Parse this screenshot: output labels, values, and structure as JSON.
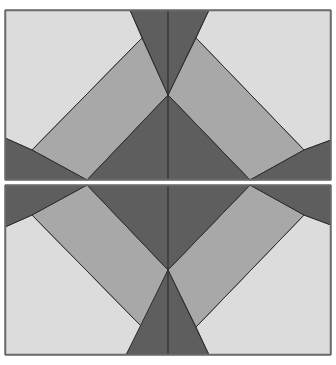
{
  "figure": {
    "colors": {
      "background": "#ffffff",
      "light": "#dcdcdc",
      "medium": "#a8a8a8",
      "dark": "#5e5e5e",
      "stroke": "#2e2e2e",
      "frame": "#6a6a6a"
    },
    "panels": [
      {
        "name": "top-panel",
        "frame": [
          5,
          10,
          326,
          170
        ],
        "shapes": [
          {
            "name": "light-left",
            "fill": "light",
            "points": "5,10 130,10 142,38 32,150 5,138"
          },
          {
            "name": "light-right",
            "fill": "light",
            "points": "209,10 331,10 331,140 304,150 196,38"
          },
          {
            "name": "band-left",
            "fill": "medium",
            "points": "142,38 168,95 87,180 32,150"
          },
          {
            "name": "band-right",
            "fill": "medium",
            "points": "168,95 196,38 304,150 250,180"
          },
          {
            "name": "notch-top",
            "fill": "dark",
            "points": "130,10 209,10 168,95"
          },
          {
            "name": "triangle-center",
            "fill": "dark",
            "points": "87,180 168,95 250,180"
          },
          {
            "name": "corner-left",
            "fill": "dark",
            "points": "5,138 32,150 87,180 5,180"
          },
          {
            "name": "corner-right",
            "fill": "dark",
            "points": "250,180 304,150 331,140 331,180"
          }
        ],
        "center_line": [
          168,
          10,
          168,
          180
        ]
      },
      {
        "name": "bottom-panel",
        "frame": [
          5,
          185,
          326,
          170
        ],
        "shapes": [
          {
            "name": "light-left",
            "fill": "light",
            "points": "5,355 126,355 142,327 32,215 5,227"
          },
          {
            "name": "light-right",
            "fill": "light",
            "points": "209,355 331,355 331,225 304,215 196,327"
          },
          {
            "name": "band-left",
            "fill": "medium",
            "points": "142,327 168,270 87,185 32,215"
          },
          {
            "name": "band-right",
            "fill": "medium",
            "points": "168,270 196,327 304,215 250,185"
          },
          {
            "name": "notch-bottom",
            "fill": "dark",
            "points": "126,355 209,355 168,270"
          },
          {
            "name": "triangle-center",
            "fill": "dark",
            "points": "87,185 168,270 250,185"
          },
          {
            "name": "corner-left",
            "fill": "dark",
            "points": "5,227 32,215 87,185 5,185"
          },
          {
            "name": "corner-right",
            "fill": "dark",
            "points": "250,185 304,215 331,225 331,185"
          }
        ],
        "center_line": [
          168,
          185,
          168,
          355
        ]
      }
    ]
  }
}
